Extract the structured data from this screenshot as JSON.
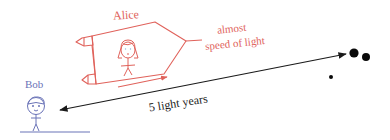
{
  "diagram": {
    "colors": {
      "alice": "#e0625b",
      "bob": "#6b74b8",
      "arrow": "#1a1a1a",
      "stars": "#0a0a0a",
      "background": "#ffffff"
    },
    "alice": {
      "label": "Alice",
      "speed_label_line1": "almost",
      "speed_label_line2": "speed of light"
    },
    "bob": {
      "label": "Bob"
    },
    "distance": {
      "label": "5 light years"
    },
    "destination": {
      "name": "star system",
      "stars": [
        {
          "cx": 354,
          "cy": 53,
          "r": 4.6
        },
        {
          "cx": 366,
          "cy": 57,
          "r": 4.0
        },
        {
          "cx": 331,
          "cy": 77,
          "r": 2.0
        }
      ]
    }
  }
}
